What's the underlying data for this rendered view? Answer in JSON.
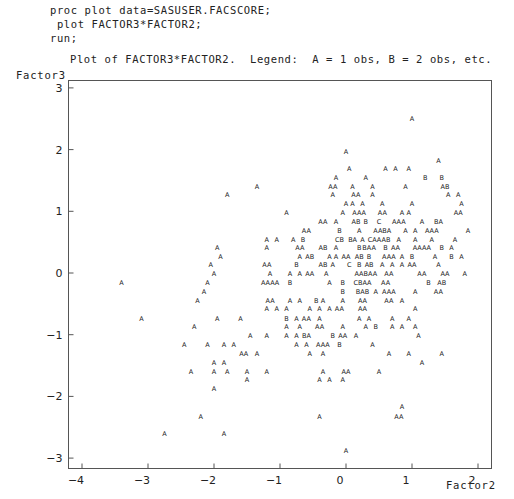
{
  "code": {
    "line1": "proc plot data=SASUSER.FACSCORE;",
    "line2": " plot FACTOR3*FACTOR2;",
    "line3": "run;"
  },
  "chart_data": {
    "type": "scatter",
    "title": "Plot of FACTOR3*FACTOR2.  Legend:  A = 1 obs, B = 2 obs, etc.",
    "xlabel": "Factor2",
    "ylabel": "Factor3",
    "xlim": [
      -4.2,
      2.2
    ],
    "ylim": [
      -3.2,
      3.1
    ],
    "xticks": [
      -4,
      -3,
      -2,
      -1,
      0,
      1,
      2
    ],
    "yticks": [
      3,
      2,
      1,
      0,
      -1,
      -2,
      -3
    ],
    "xtick_labels": [
      "−4",
      "−3",
      "−2",
      "−1",
      "0",
      "1",
      "2"
    ],
    "ytick_labels": [
      "3",
      "2",
      "1",
      "0",
      "−1",
      "−2",
      "−3"
    ],
    "legend": {
      "A": 1,
      "B": 2,
      "C": 3
    },
    "grid": false,
    "points": [
      [
        1.0,
        2.5,
        "A"
      ],
      [
        0.0,
        1.97,
        "A"
      ],
      [
        1.4,
        1.83,
        "A"
      ],
      [
        0.05,
        1.7,
        "A"
      ],
      [
        0.6,
        1.7,
        "A"
      ],
      [
        0.75,
        1.7,
        "A"
      ],
      [
        0.95,
        1.7,
        "A"
      ],
      [
        -0.15,
        1.55,
        "A"
      ],
      [
        0.3,
        1.55,
        "A"
      ],
      [
        1.2,
        1.55,
        "B"
      ],
      [
        1.45,
        1.55,
        "B"
      ],
      [
        -1.35,
        1.4,
        "A"
      ],
      [
        -0.2,
        1.4,
        "AA"
      ],
      [
        0.1,
        1.4,
        "A"
      ],
      [
        0.4,
        1.4,
        "A"
      ],
      [
        0.9,
        1.4,
        "A"
      ],
      [
        1.5,
        1.4,
        "AB"
      ],
      [
        -1.8,
        1.27,
        "A"
      ],
      [
        -0.2,
        1.27,
        "A"
      ],
      [
        0.15,
        1.27,
        "AA"
      ],
      [
        0.4,
        1.27,
        "A"
      ],
      [
        1.55,
        1.27,
        "A"
      ],
      [
        1.7,
        1.27,
        "A"
      ],
      [
        0.0,
        1.12,
        "A"
      ],
      [
        0.1,
        1.12,
        "A"
      ],
      [
        0.25,
        1.12,
        "A"
      ],
      [
        0.55,
        1.12,
        "A"
      ],
      [
        1.0,
        1.12,
        "A"
      ],
      [
        1.75,
        1.12,
        "A"
      ],
      [
        -0.9,
        0.98,
        "A"
      ],
      [
        -0.05,
        0.98,
        "A"
      ],
      [
        0.2,
        0.98,
        "AAA"
      ],
      [
        0.55,
        0.98,
        "AA"
      ],
      [
        0.85,
        0.98,
        "A"
      ],
      [
        0.95,
        0.98,
        "A"
      ],
      [
        1.7,
        0.98,
        "AA"
      ],
      [
        -0.35,
        0.84,
        "AA"
      ],
      [
        -0.15,
        0.84,
        "A"
      ],
      [
        0.15,
        0.84,
        "AB"
      ],
      [
        0.3,
        0.84,
        "B"
      ],
      [
        0.5,
        0.84,
        "C"
      ],
      [
        0.8,
        0.84,
        "AAA"
      ],
      [
        1.15,
        0.84,
        "A"
      ],
      [
        1.4,
        0.84,
        "BA"
      ],
      [
        -0.6,
        0.69,
        "AA"
      ],
      [
        -0.1,
        0.69,
        "B"
      ],
      [
        0.2,
        0.69,
        "A"
      ],
      [
        0.55,
        0.69,
        "AABA"
      ],
      [
        0.9,
        0.69,
        "A"
      ],
      [
        1.05,
        0.69,
        "A"
      ],
      [
        1.3,
        0.69,
        "AAA"
      ],
      [
        1.85,
        0.69,
        "A"
      ],
      [
        -1.2,
        0.55,
        "A"
      ],
      [
        -1.05,
        0.55,
        "A"
      ],
      [
        -0.8,
        0.55,
        "A"
      ],
      [
        -0.65,
        0.55,
        "B"
      ],
      [
        -0.1,
        0.55,
        "CB"
      ],
      [
        0.1,
        0.55,
        "BA"
      ],
      [
        0.25,
        0.55,
        "A"
      ],
      [
        0.5,
        0.55,
        "CAAAB"
      ],
      [
        0.8,
        0.55,
        "A"
      ],
      [
        1.05,
        0.55,
        "A"
      ],
      [
        1.3,
        0.55,
        "A"
      ],
      [
        1.65,
        0.55,
        "A"
      ],
      [
        -1.95,
        0.41,
        "A"
      ],
      [
        -1.2,
        0.41,
        "A"
      ],
      [
        -0.7,
        0.41,
        "AA"
      ],
      [
        -0.35,
        0.41,
        "AB"
      ],
      [
        -0.15,
        0.41,
        "A"
      ],
      [
        0.2,
        0.41,
        "B"
      ],
      [
        0.35,
        0.41,
        "BAA"
      ],
      [
        0.6,
        0.41,
        "B"
      ],
      [
        0.75,
        0.41,
        "AA"
      ],
      [
        1.15,
        0.41,
        "AAAA"
      ],
      [
        1.45,
        0.41,
        "B"
      ],
      [
        1.6,
        0.41,
        "A"
      ],
      [
        -1.9,
        0.27,
        "A"
      ],
      [
        -0.7,
        0.27,
        "A"
      ],
      [
        -0.55,
        0.27,
        "AB"
      ],
      [
        -0.25,
        0.27,
        "A"
      ],
      [
        -0.15,
        0.27,
        "A"
      ],
      [
        0.0,
        0.27,
        "AA"
      ],
      [
        0.2,
        0.27,
        "AB"
      ],
      [
        0.35,
        0.27,
        "B"
      ],
      [
        0.65,
        0.27,
        "AAA"
      ],
      [
        0.85,
        0.27,
        "A"
      ],
      [
        1.0,
        0.27,
        "B"
      ],
      [
        1.35,
        0.27,
        "A"
      ],
      [
        1.6,
        0.27,
        "B"
      ],
      [
        1.75,
        0.27,
        "A"
      ],
      [
        -2.05,
        0.13,
        "A"
      ],
      [
        -1.2,
        0.13,
        "AA"
      ],
      [
        -0.75,
        0.13,
        "B"
      ],
      [
        -0.35,
        0.13,
        "AB"
      ],
      [
        -0.2,
        0.13,
        "A"
      ],
      [
        0.05,
        0.13,
        "C"
      ],
      [
        0.2,
        0.13,
        "B"
      ],
      [
        0.35,
        0.13,
        "AB"
      ],
      [
        0.55,
        0.13,
        "A"
      ],
      [
        0.7,
        0.13,
        "A"
      ],
      [
        0.85,
        0.13,
        "A"
      ],
      [
        1.0,
        0.13,
        "AA"
      ],
      [
        1.4,
        0.13,
        "A"
      ],
      [
        -2.0,
        -0.01,
        "A"
      ],
      [
        -1.15,
        -0.01,
        "A"
      ],
      [
        -0.85,
        -0.01,
        "A"
      ],
      [
        -0.7,
        -0.01,
        "A"
      ],
      [
        -0.55,
        -0.01,
        "AA"
      ],
      [
        -0.3,
        -0.01,
        "A"
      ],
      [
        0.3,
        -0.01,
        "AABAA"
      ],
      [
        0.65,
        -0.01,
        "AA"
      ],
      [
        1.15,
        -0.01,
        "AA"
      ],
      [
        1.5,
        -0.01,
        "AA"
      ],
      [
        1.8,
        -0.01,
        "A"
      ],
      [
        -3.4,
        -0.15,
        "A"
      ],
      [
        -2.1,
        -0.15,
        "A"
      ],
      [
        -1.15,
        -0.15,
        "AAAA"
      ],
      [
        -0.85,
        -0.15,
        "B"
      ],
      [
        -0.25,
        -0.15,
        "A"
      ],
      [
        -0.05,
        -0.15,
        "B"
      ],
      [
        0.25,
        -0.15,
        "CBAA"
      ],
      [
        0.6,
        -0.15,
        "AA"
      ],
      [
        1.25,
        -0.15,
        "B"
      ],
      [
        1.45,
        -0.15,
        "AB"
      ],
      [
        -2.15,
        -0.3,
        "A"
      ],
      [
        -0.05,
        -0.3,
        "B"
      ],
      [
        0.25,
        -0.3,
        "BAB"
      ],
      [
        0.45,
        -0.3,
        "A"
      ],
      [
        0.65,
        -0.3,
        "AAA"
      ],
      [
        1.05,
        -0.3,
        "A"
      ],
      [
        1.4,
        -0.3,
        "AA"
      ],
      [
        -2.25,
        -0.44,
        "A"
      ],
      [
        -1.15,
        -0.44,
        "AA"
      ],
      [
        -0.85,
        -0.44,
        "A"
      ],
      [
        -0.7,
        -0.44,
        "A"
      ],
      [
        -0.45,
        -0.44,
        "B"
      ],
      [
        -0.35,
        -0.44,
        "A"
      ],
      [
        -0.05,
        -0.44,
        "A"
      ],
      [
        0.25,
        -0.44,
        "AA"
      ],
      [
        0.65,
        -0.44,
        "AA"
      ],
      [
        0.85,
        -0.44,
        "A"
      ],
      [
        -1.2,
        -0.58,
        "A"
      ],
      [
        -1.05,
        -0.58,
        "A"
      ],
      [
        -0.9,
        -0.58,
        "A"
      ],
      [
        -0.55,
        -0.58,
        "A"
      ],
      [
        -0.4,
        -0.58,
        "A"
      ],
      [
        -0.25,
        -0.58,
        "A"
      ],
      [
        -0.1,
        -0.58,
        "AA"
      ],
      [
        0.25,
        -0.58,
        "AA"
      ],
      [
        1.05,
        -0.58,
        "A"
      ],
      [
        -3.1,
        -0.73,
        "A"
      ],
      [
        -1.95,
        -0.73,
        "A"
      ],
      [
        -1.6,
        -0.73,
        "A"
      ],
      [
        -0.9,
        -0.73,
        "B"
      ],
      [
        -0.75,
        -0.73,
        "A"
      ],
      [
        -0.6,
        -0.73,
        "AA"
      ],
      [
        -0.4,
        -0.73,
        "A"
      ],
      [
        0.2,
        -0.73,
        "A"
      ],
      [
        0.35,
        -0.73,
        "A"
      ],
      [
        0.7,
        -0.73,
        "A"
      ],
      [
        0.95,
        -0.73,
        "A"
      ],
      [
        -2.3,
        -0.87,
        "A"
      ],
      [
        -0.9,
        -0.87,
        "A"
      ],
      [
        -0.7,
        -0.87,
        "A"
      ],
      [
        -0.4,
        -0.87,
        "AA"
      ],
      [
        -0.05,
        -0.87,
        "A"
      ],
      [
        0.3,
        -0.87,
        "A"
      ],
      [
        0.45,
        -0.87,
        "B"
      ],
      [
        0.7,
        -0.87,
        "A"
      ],
      [
        0.85,
        -0.87,
        "A"
      ],
      [
        1.05,
        -0.87,
        "A"
      ],
      [
        -1.45,
        -1.02,
        "A"
      ],
      [
        -1.2,
        -1.02,
        "A"
      ],
      [
        -0.9,
        -1.02,
        "A"
      ],
      [
        -0.75,
        -1.02,
        "A"
      ],
      [
        -0.6,
        -1.02,
        "BA"
      ],
      [
        -0.2,
        -1.02,
        "B"
      ],
      [
        -0.05,
        -1.02,
        "AA"
      ],
      [
        0.15,
        -1.02,
        "A"
      ],
      [
        1.1,
        -1.02,
        "A"
      ],
      [
        -2.45,
        -1.16,
        "A"
      ],
      [
        -2.1,
        -1.16,
        "A"
      ],
      [
        -1.85,
        -1.16,
        "A"
      ],
      [
        -1.7,
        -1.16,
        "A"
      ],
      [
        -0.75,
        -1.16,
        "A"
      ],
      [
        -0.6,
        -1.16,
        "A"
      ],
      [
        -0.35,
        -1.16,
        "AAA"
      ],
      [
        -0.1,
        -1.16,
        "B"
      ],
      [
        0.4,
        -1.16,
        "A"
      ],
      [
        -1.55,
        -1.3,
        "AA"
      ],
      [
        -1.35,
        -1.3,
        "A"
      ],
      [
        -0.55,
        -1.3,
        "A"
      ],
      [
        -0.35,
        -1.3,
        "A"
      ],
      [
        0.65,
        -1.3,
        "A"
      ],
      [
        0.95,
        -1.3,
        "A"
      ],
      [
        1.45,
        -1.3,
        "A"
      ],
      [
        -2.0,
        -1.45,
        "A"
      ],
      [
        -1.85,
        -1.45,
        "A"
      ],
      [
        1.15,
        -1.45,
        "A"
      ],
      [
        -2.35,
        -1.59,
        "A"
      ],
      [
        -2.0,
        -1.59,
        "A"
      ],
      [
        -1.8,
        -1.59,
        "A"
      ],
      [
        -1.5,
        -1.59,
        "A"
      ],
      [
        -1.2,
        -1.59,
        "A"
      ],
      [
        -0.35,
        -1.59,
        "A"
      ],
      [
        0.0,
        -1.59,
        "AA"
      ],
      [
        0.5,
        -1.59,
        "A"
      ],
      [
        -1.5,
        -1.73,
        "A"
      ],
      [
        -0.4,
        -1.73,
        "A"
      ],
      [
        -0.25,
        -1.73,
        "A"
      ],
      [
        -0.05,
        -1.73,
        "A"
      ],
      [
        -2.0,
        -1.88,
        "A"
      ],
      [
        0.85,
        -2.17,
        "A"
      ],
      [
        -0.4,
        -2.32,
        "A"
      ],
      [
        0.8,
        -2.32,
        "AA"
      ],
      [
        -2.2,
        -2.32,
        "A"
      ],
      [
        -2.75,
        -2.6,
        "A"
      ],
      [
        -1.85,
        -2.6,
        "A"
      ],
      [
        0.0,
        -2.88,
        "A"
      ]
    ]
  }
}
